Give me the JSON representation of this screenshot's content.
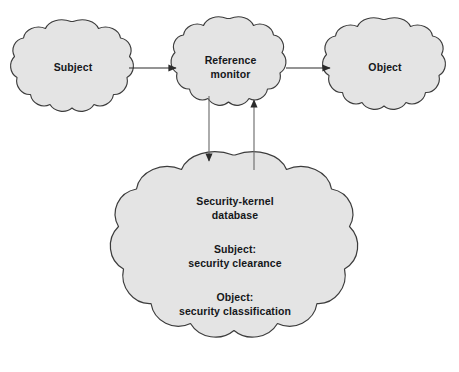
{
  "diagram": {
    "style": {
      "cloud_fill": "#e4e4e4",
      "cloud_stroke": "#3c3c3c",
      "arrow_color": "#2b2b2b",
      "text_color": "#15171a",
      "background": "#ffffff"
    },
    "nodes": [
      {
        "id": "subject",
        "shape": "cloud",
        "lines": [
          "Subject"
        ],
        "cx": 73,
        "cy": 68,
        "rx": 55,
        "ry": 47
      },
      {
        "id": "reference-monitor",
        "shape": "cloud",
        "lines": [
          "Reference",
          "monitor"
        ],
        "cx": 230,
        "cy": 66,
        "rx": 52,
        "ry": 48
      },
      {
        "id": "object",
        "shape": "cloud",
        "lines": [
          "Object"
        ],
        "cx": 385,
        "cy": 67,
        "rx": 55,
        "ry": 48
      },
      {
        "id": "security-kernel-database",
        "shape": "cloud",
        "lines": [
          "Security-kernel",
          "database",
          "Subject:",
          "security clearance",
          "Object:",
          "security classification"
        ],
        "cx": 235,
        "cy": 250,
        "rx": 113,
        "ry": 95
      }
    ],
    "edges": [
      {
        "id": "subject-to-reference-monitor",
        "from": "subject",
        "to": "reference-monitor",
        "direction": "right",
        "arrowhead": "end"
      },
      {
        "id": "reference-monitor-to-object",
        "from": "reference-monitor",
        "to": "object",
        "direction": "right",
        "arrowhead": "end"
      },
      {
        "id": "reference-monitor-to-database",
        "from": "reference-monitor",
        "to": "security-kernel-database",
        "direction": "down",
        "arrowhead": "end"
      },
      {
        "id": "database-to-reference-monitor",
        "from": "security-kernel-database",
        "to": "reference-monitor",
        "direction": "up",
        "arrowhead": "end"
      }
    ],
    "labels": {
      "subject": "Subject",
      "reference_monitor_line1": "Reference",
      "reference_monitor_line2": "monitor",
      "object": "Object",
      "db_title_line1": "Security-kernel",
      "db_title_line2": "database",
      "db_subject_line1": "Subject:",
      "db_subject_line2": "security clearance",
      "db_object_line1": "Object:",
      "db_object_line2": "security classification"
    }
  }
}
